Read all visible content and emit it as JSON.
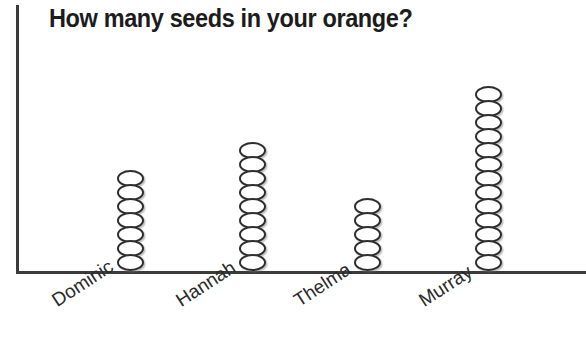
{
  "chart_data": {
    "type": "bar",
    "subtype": "pictograph",
    "title": "How many seeds in your orange?",
    "xlabel": "",
    "ylabel": "",
    "categories": [
      "Dominic",
      "Hannah",
      "Thelma",
      "Murray"
    ],
    "values": [
      7,
      9,
      5,
      13
    ],
    "unit_symbol": "seed",
    "unit_value": 1,
    "grid": false,
    "legend": false,
    "axis_ticks": false,
    "ylim": [
      0,
      13
    ],
    "colors": {
      "axis": "#3b3b3b",
      "title": "#1c1c1c",
      "label": "#2b2b2b",
      "seed_outline": "#2e2e2e",
      "seed_fill": "#ffffff",
      "background": "#ffffff"
    }
  },
  "axes": {
    "y_axis_name": "vertical-axis",
    "x_axis_name": "horizontal-axis"
  }
}
